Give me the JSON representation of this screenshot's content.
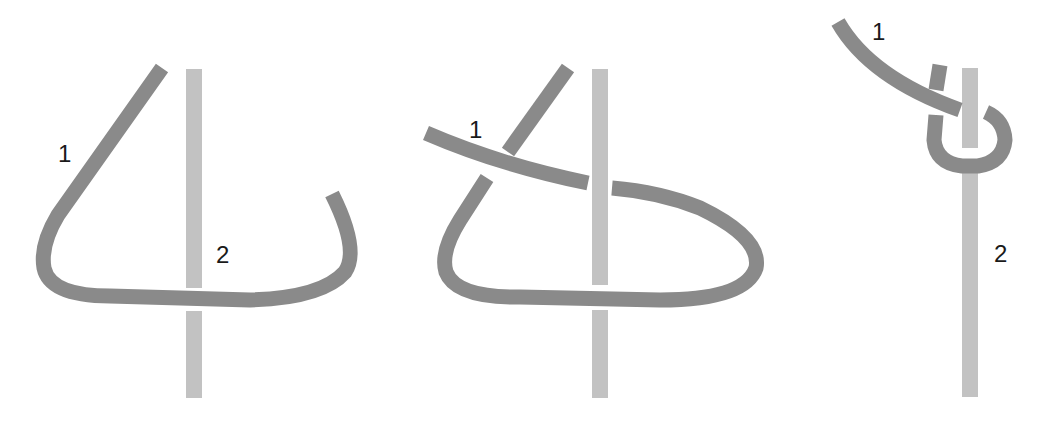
{
  "diagram": {
    "colors": {
      "rope_1": "#8a8a8a",
      "rope_2": "#c2c2c2",
      "label": "#1a1a1a",
      "background": "#ffffff"
    },
    "panels": [
      {
        "step": 1,
        "labels": {
          "rope_1": "1",
          "rope_2": "2"
        }
      },
      {
        "step": 2,
        "labels": {
          "rope_1": "1"
        }
      },
      {
        "step": 3,
        "labels": {
          "rope_1": "1",
          "rope_2": "2"
        }
      }
    ]
  }
}
